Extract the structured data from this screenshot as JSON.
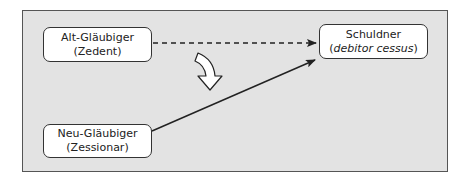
{
  "diagram": {
    "nodes": {
      "alt_glaeubiger": {
        "line1": "Alt-Gläubiger",
        "line2": "(Zedent)"
      },
      "schuldner": {
        "line1": "Schuldner",
        "line2_prefix": "(",
        "line2_italic": "debitor cessus",
        "line2_suffix": ")"
      },
      "neu_glaeubiger": {
        "line1": "Neu-Gläubiger",
        "line2": "(Zessionar)"
      }
    },
    "edges": [
      {
        "from": "Alt-Gläubiger",
        "to": "Schuldner",
        "style": "dashed"
      },
      {
        "from": "Neu-Gläubiger",
        "to": "Schuldner",
        "style": "solid"
      },
      {
        "from": "Alt-Gläubiger",
        "to": "Neu-Gläubiger",
        "style": "curved-hollow-arrow"
      }
    ],
    "colors": {
      "background": "#e3e3e3",
      "node_fill": "#ffffff",
      "stroke": "#222222"
    }
  }
}
